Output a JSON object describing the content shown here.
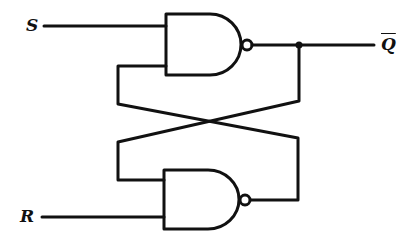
{
  "diagram": {
    "labels": {
      "set_input": "S",
      "reset_input": "R",
      "output": "Q"
    },
    "output_inverted": true,
    "components": [
      {
        "type": "NAND",
        "name": "top-gate",
        "inputs": [
          "S",
          "feedback from bottom gate"
        ],
        "output": "Q-bar"
      },
      {
        "type": "NAND",
        "name": "bottom-gate",
        "inputs": [
          "feedback from top gate",
          "R"
        ],
        "output": "Q"
      }
    ],
    "colors": {
      "stroke": "#111111",
      "background": "#ffffff"
    }
  }
}
